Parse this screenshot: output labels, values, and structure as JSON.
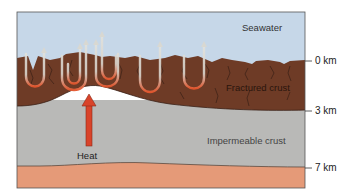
{
  "diagram": {
    "labels": {
      "seawater": "Seawater",
      "fractured_crust": "Fractured crust",
      "impermeable_crust": "Impermeable crust",
      "heat": "Heat"
    },
    "depth_ticks": [
      {
        "label": "0 km"
      },
      {
        "label": "3 km"
      },
      {
        "label": "7 km"
      }
    ],
    "colors": {
      "seawater": "#c6d7e8",
      "fractured_crust": "#6e3b26",
      "impermeable_crust": "#b9b9b7",
      "mantle_layer": "#e59a78",
      "heat_arrow": "#d9432a",
      "flow_arrows": "#d8d8d2",
      "flow_hot": "#e4572e"
    }
  }
}
